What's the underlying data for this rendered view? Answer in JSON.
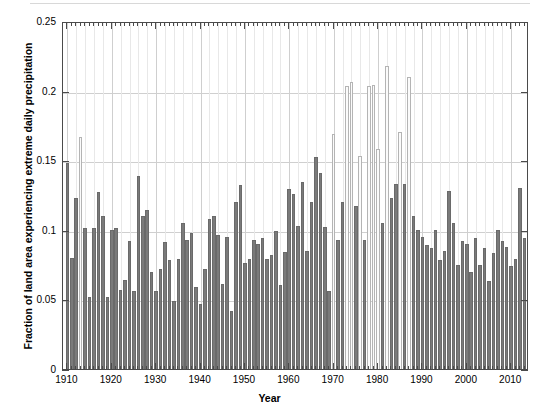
{
  "figure": {
    "background_color": "#ffffff",
    "axis_color": "#4a4a4a",
    "grid_color": "#cfcfcf",
    "bar_color_dark": "#7a7a7a",
    "bar_color_light": "#fbfbfb"
  },
  "axes": {
    "y_title": "Fraction of land area experiencing extreme daily precipitation",
    "x_title": "Year",
    "y_ticks": [
      "0",
      "0.05",
      "0.1",
      "0.15",
      "0.2",
      "0.25"
    ],
    "x_ticks": [
      "1910",
      "1920",
      "1930",
      "1940",
      "1950",
      "1960",
      "1970",
      "1980",
      "1990",
      "2000",
      "2010"
    ]
  },
  "chart_data": {
    "type": "bar",
    "title": "",
    "xlabel": "Year",
    "ylabel": "Fraction of land area experiencing extreme daily precipitation",
    "xlim": [
      1909,
      2014
    ],
    "ylim": [
      0,
      0.25
    ],
    "grid": true,
    "legend": null,
    "categories": [
      1910,
      1911,
      1912,
      1913,
      1914,
      1915,
      1916,
      1917,
      1918,
      1919,
      1920,
      1921,
      1922,
      1923,
      1924,
      1925,
      1926,
      1927,
      1928,
      1929,
      1930,
      1931,
      1932,
      1933,
      1934,
      1935,
      1936,
      1937,
      1938,
      1939,
      1940,
      1941,
      1942,
      1943,
      1944,
      1945,
      1946,
      1947,
      1948,
      1949,
      1950,
      1951,
      1952,
      1953,
      1954,
      1955,
      1956,
      1957,
      1958,
      1959,
      1960,
      1961,
      1962,
      1963,
      1964,
      1965,
      1966,
      1967,
      1968,
      1969,
      1970,
      1971,
      1972,
      1973,
      1974,
      1975,
      1976,
      1977,
      1978,
      1979,
      1980,
      1981,
      1982,
      1983,
      1984,
      1985,
      1986,
      1987,
      1988,
      1989,
      1990,
      1991,
      1992,
      1993,
      1994,
      1995,
      1996,
      1997,
      1998,
      1999,
      2000,
      2001,
      2002,
      2003,
      2004,
      2005,
      2006,
      2007,
      2008,
      2009,
      2010,
      2011,
      2012,
      2013
    ],
    "values": [
      0.148,
      0.08,
      0.123,
      0.167,
      0.101,
      0.052,
      0.101,
      0.127,
      0.11,
      0.052,
      0.1,
      0.101,
      0.057,
      0.064,
      0.092,
      0.056,
      0.139,
      0.11,
      0.114,
      0.07,
      0.056,
      0.072,
      0.091,
      0.078,
      0.049,
      0.079,
      0.105,
      0.093,
      0.098,
      0.059,
      0.047,
      0.072,
      0.108,
      0.11,
      0.096,
      0.061,
      0.095,
      0.042,
      0.12,
      0.132,
      0.076,
      0.079,
      0.093,
      0.09,
      0.094,
      0.079,
      0.082,
      0.099,
      0.06,
      0.084,
      0.129,
      0.126,
      0.103,
      0.134,
      0.085,
      0.12,
      0.152,
      0.141,
      0.102,
      0.056,
      0.169,
      0.093,
      0.12,
      0.203,
      0.206,
      0.117,
      0.153,
      0.093,
      0.203,
      0.204,
      0.158,
      0.105,
      0.218,
      0.123,
      0.133,
      0.17,
      0.133,
      0.21,
      0.11,
      0.1,
      0.095,
      0.089,
      0.087,
      0.1,
      0.078,
      0.085,
      0.128,
      0.105,
      0.075,
      0.092,
      0.09,
      0.07,
      0.094,
      0.075,
      0.087,
      0.063,
      0.083,
      0.1,
      0.092,
      0.088,
      0.074,
      0.079,
      0.13,
      0.094
    ],
    "highlight_indices": [
      3,
      60,
      63,
      64,
      66,
      68,
      69,
      70,
      72,
      75,
      77
    ],
    "note": "Values read from gridline positions; axis max 0.25, gridlines every 0.05"
  }
}
